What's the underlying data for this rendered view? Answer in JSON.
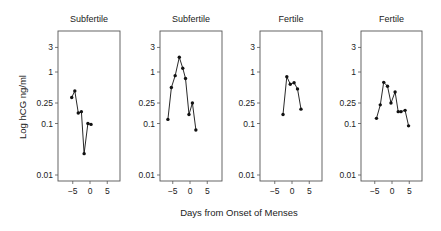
{
  "chart_data": {
    "type": "line",
    "title": "",
    "xlabel": "Days from Onset of Menses",
    "ylabel": "Log hCG ng/ml",
    "yscale": "log",
    "ylim": [
      0.006,
      7
    ],
    "xlim": [
      -9,
      9
    ],
    "yticks": [
      3,
      1,
      0.25,
      0.1,
      0.01
    ],
    "ytick_labels": [
      "3",
      "1",
      "0.25",
      "0.1",
      "0.01"
    ],
    "xticks": [
      -5,
      0,
      5
    ],
    "xtick_labels": [
      "−5",
      "0",
      "5"
    ],
    "grid": false,
    "legend": null,
    "panels": [
      {
        "title": "Subfertile",
        "x": [
          -5.3,
          -4.4,
          -3.4,
          -2.5,
          -1.7,
          -0.6,
          0.3
        ],
        "y": [
          0.32,
          0.43,
          0.16,
          0.17,
          0.026,
          0.1,
          0.096
        ]
      },
      {
        "title": "Subfertile",
        "x": [
          -6.4,
          -5.4,
          -4.3,
          -3.1,
          -2.1,
          -1.3,
          -0.3,
          0.7,
          1.7
        ],
        "y": [
          0.12,
          0.5,
          0.85,
          1.93,
          1.18,
          0.75,
          0.15,
          0.25,
          0.075
        ]
      },
      {
        "title": "Fertile",
        "x": [
          -2.6,
          -1.5,
          -0.5,
          0.6,
          1.6,
          2.6
        ],
        "y": [
          0.15,
          0.81,
          0.58,
          0.62,
          0.47,
          0.19
        ]
      },
      {
        "title": "Fertile",
        "x": [
          -4.5,
          -3.4,
          -2.4,
          -1.3,
          -0.3,
          0.9,
          1.8,
          2.6,
          3.8,
          4.8
        ],
        "y": [
          0.126,
          0.23,
          0.63,
          0.53,
          0.25,
          0.41,
          0.17,
          0.17,
          0.18,
          0.09
        ]
      }
    ]
  }
}
